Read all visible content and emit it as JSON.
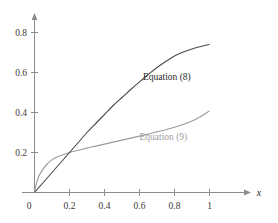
{
  "figure": {
    "background_color": "#ffffff",
    "axis_color": "#8c8c8c",
    "x_axis_label": "x",
    "y_axis_label": ""
  },
  "chart_data": {
    "type": "line",
    "title": "",
    "subtitle": "",
    "xlabel": "x",
    "ylabel": "",
    "xlim": [
      0,
      1.12
    ],
    "ylim": [
      0,
      0.92
    ],
    "grid": false,
    "legend_position": "inline-annotation",
    "x_ticks": [
      "0",
      "0.2",
      "0.4",
      "0.6",
      "0.8",
      "1"
    ],
    "x_tick_values": [
      0,
      0.2,
      0.4,
      0.6,
      0.8,
      1
    ],
    "y_ticks": [
      "0.2",
      "0.4",
      "0.6",
      "0.8"
    ],
    "y_tick_values": [
      0.2,
      0.4,
      0.6,
      0.8
    ],
    "series": [
      {
        "name": "Equation (8)",
        "color": "#4a4a4a",
        "label_text": "Equation (8)",
        "x": [
          0,
          0.05,
          0.1,
          0.15,
          0.2,
          0.25,
          0.3,
          0.35,
          0.4,
          0.45,
          0.5,
          0.55,
          0.6,
          0.65,
          0.7,
          0.75,
          0.8,
          0.85,
          0.9,
          0.95,
          1
        ],
        "values": [
          0,
          0.05,
          0.1,
          0.15,
          0.2,
          0.25,
          0.3,
          0.345,
          0.39,
          0.435,
          0.475,
          0.515,
          0.553,
          0.59,
          0.625,
          0.655,
          0.682,
          0.702,
          0.718,
          0.73,
          0.74
        ]
      },
      {
        "name": "Equation (9)",
        "color": "#9b9b9b",
        "label_text": "Equation (9)",
        "x": [
          0,
          0.01,
          0.025,
          0.05,
          0.075,
          0.1,
          0.125,
          0.15,
          0.2,
          0.25,
          0.3,
          0.35,
          0.4,
          0.45,
          0.5,
          0.55,
          0.6,
          0.65,
          0.7,
          0.75,
          0.8,
          0.85,
          0.9,
          0.95,
          1
        ],
        "values": [
          0,
          0.042,
          0.082,
          0.118,
          0.145,
          0.163,
          0.176,
          0.185,
          0.2,
          0.211,
          0.222,
          0.232,
          0.242,
          0.252,
          0.262,
          0.272,
          0.282,
          0.292,
          0.303,
          0.314,
          0.326,
          0.34,
          0.357,
          0.38,
          0.408
        ]
      }
    ],
    "annotations": [
      {
        "text": "Equation (8)",
        "x": 0.62,
        "y": 0.565,
        "color": "#2b2b2b"
      },
      {
        "text": "Equation (9)",
        "x": 0.6,
        "y": 0.265,
        "color": "#a0a0a0"
      }
    ]
  }
}
